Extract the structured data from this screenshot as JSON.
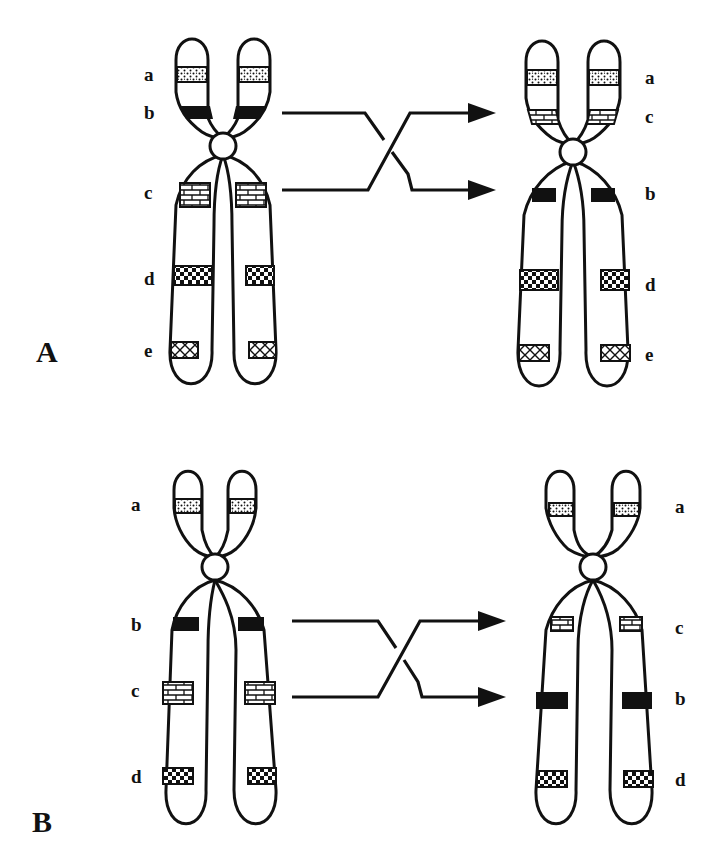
{
  "colors": {
    "ink": "#111111",
    "background": "#ffffff"
  },
  "patterns": {
    "a": "stippled",
    "b": "solid-black",
    "c": "brick",
    "d": "checker",
    "e": "cross-hatch"
  },
  "panels": [
    {
      "id": "A",
      "label": "A",
      "label_pos": [
        45,
        362
      ],
      "centromere_type": "paracentric-inversion",
      "before": {
        "centromere": [
          223,
          146
        ],
        "bands": [
          {
            "gene": "a",
            "label": "a",
            "y": 75
          },
          {
            "gene": "b",
            "label": "b",
            "y": 113
          },
          {
            "gene": "c",
            "label": "c",
            "y": 195
          },
          {
            "gene": "d",
            "label": "d",
            "y": 278
          },
          {
            "gene": "e",
            "label": "e",
            "y": 352
          }
        ],
        "label_x": 148,
        "label_side": "left"
      },
      "after": {
        "centromere": [
          573,
          152
        ],
        "bands": [
          {
            "gene": "a",
            "label": "a",
            "y": 78
          },
          {
            "gene": "c",
            "label": "c",
            "y": 117
          },
          {
            "gene": "b",
            "label": "b",
            "y": 195
          },
          {
            "gene": "d",
            "label": "d",
            "y": 285
          },
          {
            "gene": "e",
            "label": "e",
            "y": 355
          }
        ],
        "label_x": 645,
        "label_side": "right"
      },
      "arrow": {
        "x1": 282,
        "x2": 495,
        "y_top": 113,
        "y_bottom": 190
      }
    },
    {
      "id": "B",
      "label": "B",
      "label_pos": [
        35,
        835
      ],
      "centromere_type": "pericentric-inversion",
      "before": {
        "centromere": [
          215,
          567
        ],
        "bands": [
          {
            "gene": "a",
            "label": "a",
            "y": 505
          },
          {
            "gene": "b",
            "label": "b",
            "y": 624
          },
          {
            "gene": "c",
            "label": "c",
            "y": 692
          },
          {
            "gene": "d",
            "label": "d",
            "y": 778
          }
        ],
        "label_x": 137,
        "label_side": "left"
      },
      "after": {
        "centromere": [
          593,
          567
        ],
        "bands": [
          {
            "gene": "a",
            "label": "a",
            "y": 508
          },
          {
            "gene": "c",
            "label": "c",
            "y": 628
          },
          {
            "gene": "b",
            "label": "b",
            "y": 700
          },
          {
            "gene": "d",
            "label": "d",
            "y": 780
          }
        ],
        "label_x": 675,
        "label_side": "right"
      },
      "arrow": {
        "x1": 292,
        "x2": 505,
        "y_top": 621,
        "y_bottom": 697
      }
    }
  ]
}
